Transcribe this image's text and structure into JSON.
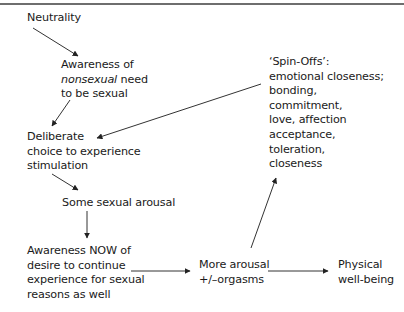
{
  "diagram": {
    "type": "flowchart",
    "nodes": {
      "neutrality": {
        "lines": [
          "Neutrality"
        ]
      },
      "awareness_nonsexual": {
        "line1": "Awareness of",
        "line2_italic": "nonsexual",
        "line2_rest": " need",
        "line3": "to be sexual"
      },
      "deliberate_choice": {
        "lines": [
          "Deliberate",
          "choice to experience",
          "stimulation"
        ]
      },
      "some_arousal": {
        "lines": [
          "Some sexual arousal"
        ]
      },
      "awareness_now": {
        "lines": [
          "Awareness NOW of",
          "desire to continue",
          "experience for sexual",
          "reasons as well"
        ]
      },
      "more_arousal": {
        "lines": [
          "More arousal",
          "+/–orgasms"
        ]
      },
      "physical_wellbeing": {
        "lines": [
          "Physical",
          "well-being"
        ]
      },
      "spin_offs": {
        "lines": [
          "‘Spin-Offs’:",
          "emotional closeness;",
          "bonding,",
          "commitment,",
          "love, affection",
          "acceptance,",
          "toleration,",
          "closeness"
        ]
      }
    },
    "edges": [
      {
        "from": "neutrality",
        "to": "awareness_nonsexual"
      },
      {
        "from": "awareness_nonsexual",
        "to": "deliberate_choice"
      },
      {
        "from": "deliberate_choice",
        "to": "some_arousal"
      },
      {
        "from": "some_arousal",
        "to": "awareness_now"
      },
      {
        "from": "awareness_now",
        "to": "more_arousal"
      },
      {
        "from": "more_arousal",
        "to": "physical_wellbeing"
      },
      {
        "from": "more_arousal",
        "to": "spin_offs"
      },
      {
        "from": "spin_offs",
        "to": "deliberate_choice"
      }
    ],
    "colors": {
      "text": "#1a1a1a",
      "arrow": "#333333",
      "rule": "#6e6e6e"
    }
  }
}
